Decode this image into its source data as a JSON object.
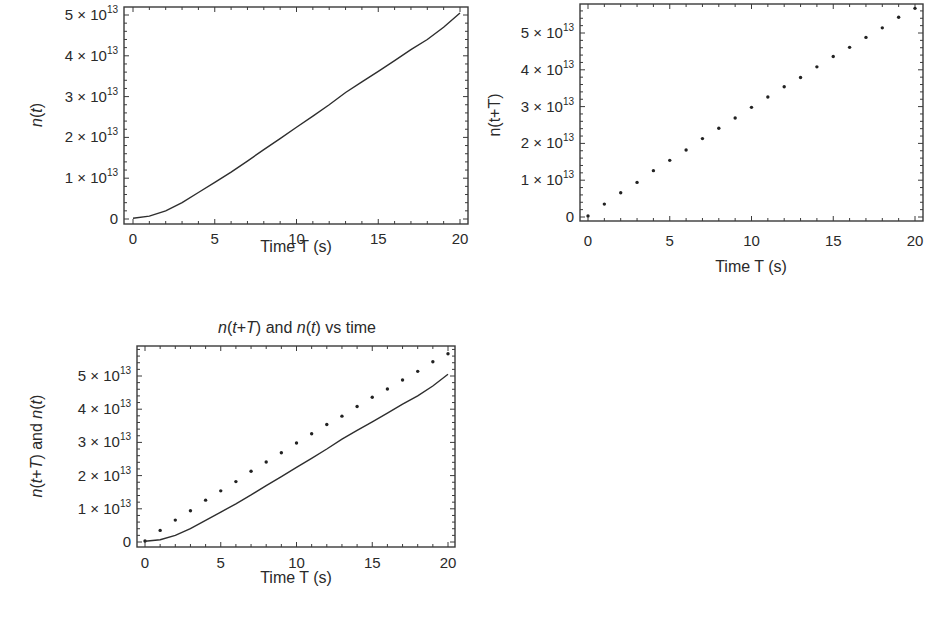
{
  "chart_data": [
    {
      "id": "plot1",
      "type": "line",
      "title": "",
      "xlabel": "Time T (s)",
      "ylabel": "n(t)",
      "xlim": [
        0,
        20
      ],
      "ylim": [
        0,
        50000000000000.0
      ],
      "x_ticks": [
        0,
        5,
        10,
        15,
        20
      ],
      "y_ticks": [
        "0",
        "1 × 10^13",
        "2 × 10^13",
        "3 × 10^13",
        "4 × 10^13",
        "5 × 10^13"
      ],
      "grid": false,
      "series": [
        {
          "name": "n(t)",
          "style": "line",
          "x": [
            0,
            1,
            2,
            3,
            4,
            5,
            6,
            7,
            8,
            9,
            10,
            11,
            12,
            13,
            14,
            15,
            16,
            17,
            18,
            19,
            20
          ],
          "values": [
            200000000000.0,
            700000000000.0,
            2000000000000.0,
            4000000000000.0,
            6500000000000.0,
            9000000000000.0,
            11500000000000.0,
            14200000000000.0,
            17000000000000.0,
            19700000000000.0,
            22500000000000.0,
            25200000000000.0,
            28000000000000.0,
            31000000000000.0,
            33600000000000.0,
            36200000000000.0,
            38800000000000.0,
            41500000000000.0,
            44000000000000.0,
            47000000000000.0,
            50500000000000.0
          ]
        }
      ]
    },
    {
      "id": "plot2",
      "type": "scatter",
      "title": "",
      "xlabel": "Time T (s)",
      "ylabel": "n(t+T)",
      "xlim": [
        0,
        20
      ],
      "ylim": [
        0,
        58000000000000.0
      ],
      "x_ticks": [
        0,
        5,
        10,
        15,
        20
      ],
      "y_ticks": [
        "0",
        "1 × 10^13",
        "2 × 10^13",
        "3 × 10^13",
        "4 × 10^13",
        "5 × 10^13"
      ],
      "grid": false,
      "series": [
        {
          "name": "n(t+T)",
          "style": "points",
          "x": [
            0,
            1,
            2,
            3,
            4,
            5,
            6,
            7,
            8,
            9,
            10,
            11,
            12,
            13,
            14,
            15,
            16,
            17,
            18,
            19,
            20
          ],
          "values": [
            300000000000.0,
            3500000000000.0,
            6600000000000.0,
            9400000000000.0,
            12600000000000.0,
            15400000000000.0,
            18200000000000.0,
            21300000000000.0,
            24100000000000.0,
            26900000000000.0,
            29800000000000.0,
            32600000000000.0,
            35400000000000.0,
            37900000000000.0,
            40800000000000.0,
            43600000000000.0,
            46100000000000.0,
            48800000000000.0,
            51400000000000.0,
            54300000000000.0,
            56700000000000.0
          ]
        }
      ]
    },
    {
      "id": "plot3",
      "type": "line",
      "title": "n(t+T) and n(t) vs time",
      "xlabel": "Time T (s)",
      "ylabel": "n(t+T) and n(t)",
      "xlim": [
        0,
        20
      ],
      "ylim": [
        0,
        58000000000000.0
      ],
      "x_ticks": [
        0,
        5,
        10,
        15,
        20
      ],
      "y_ticks": [
        "0",
        "1 × 10^13",
        "2 × 10^13",
        "3 × 10^13",
        "4 × 10^13",
        "5 × 10^13"
      ],
      "grid": false,
      "series": [
        {
          "name": "n(t+T)",
          "style": "points",
          "x": [
            0,
            1,
            2,
            3,
            4,
            5,
            6,
            7,
            8,
            9,
            10,
            11,
            12,
            13,
            14,
            15,
            16,
            17,
            18,
            19,
            20
          ],
          "values": [
            300000000000.0,
            3500000000000.0,
            6600000000000.0,
            9400000000000.0,
            12600000000000.0,
            15400000000000.0,
            18200000000000.0,
            21300000000000.0,
            24100000000000.0,
            26900000000000.0,
            29800000000000.0,
            32600000000000.0,
            35400000000000.0,
            37900000000000.0,
            40800000000000.0,
            43600000000000.0,
            46100000000000.0,
            48800000000000.0,
            51400000000000.0,
            54300000000000.0,
            56700000000000.0
          ]
        },
        {
          "name": "n(t)",
          "style": "line",
          "x": [
            0,
            1,
            2,
            3,
            4,
            5,
            6,
            7,
            8,
            9,
            10,
            11,
            12,
            13,
            14,
            15,
            16,
            17,
            18,
            19,
            20
          ],
          "values": [
            200000000000.0,
            700000000000.0,
            2000000000000.0,
            4000000000000.0,
            6500000000000.0,
            9000000000000.0,
            11500000000000.0,
            14200000000000.0,
            17000000000000.0,
            19700000000000.0,
            22500000000000.0,
            25200000000000.0,
            28000000000000.0,
            31000000000000.0,
            33600000000000.0,
            36200000000000.0,
            38800000000000.0,
            41500000000000.0,
            44000000000000.0,
            47000000000000.0,
            50500000000000.0
          ]
        }
      ]
    }
  ],
  "labels": {
    "plot1": {
      "xlabel": "Time T (s)",
      "ylabel": "n(t)"
    },
    "plot2": {
      "xlabel": "Time T (s)",
      "ylabel": "n(t+T)"
    },
    "plot3": {
      "title": "n(t+T) and n(t) vs time",
      "xlabel": "Time T (s)",
      "ylabel": "n(t+T) and n(t)"
    }
  },
  "tick_text": {
    "x": [
      "0",
      "5",
      "10",
      "15",
      "20"
    ],
    "y_mantissa": [
      "0",
      "1",
      "2",
      "3",
      "4",
      "5"
    ],
    "y_times": "×",
    "y_base": "10",
    "y_exp": "13"
  },
  "colors": {
    "ink": "#2a2a2a",
    "frame": "#3a3a3a",
    "background": "#ffffff"
  }
}
